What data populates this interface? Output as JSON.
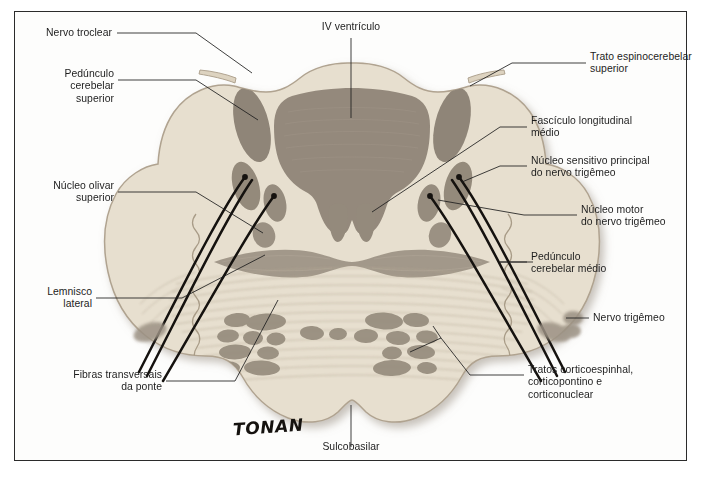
{
  "figure": {
    "signature": "TONAN",
    "colors": {
      "tissue": "#e7dfcf",
      "tissue_edge": "#b5a894",
      "gray_matter": "#8d8275",
      "nucleus": "#9a8f80",
      "leader": "#1d1d1d",
      "frame": "#2b2b2b",
      "nerve_root": "#15120f",
      "background": "#fdfdfc"
    }
  },
  "labels": {
    "nervo_troclear": "Nervo troclear",
    "pedunculo_cerebelar_superior": "Pedúnculo\ncerebelar\nsuperior",
    "nucleo_olivar_superior": "Núcleo olivar\nsuperior",
    "lemnisco_lateral": "Lemnisco\nlateral",
    "fibras_transversais_da_ponte": "Fibras transversais\nda ponte",
    "iv_ventriculo": "IV ventrículo",
    "trato_espinocerebelar_superior": "Trato espinocerebelar\nsuperior",
    "fasciculo_longitudinal_medio": "Fascículo longitudinal\nmédio",
    "nucleo_sensitivo_principal": "Núcleo sensitivo principal\ndo nervo trigêmeo",
    "nucleo_motor": "Núcleo motor\ndo nervo trigêmeo",
    "pedunculo_cerebelar_medio": "Pedúnculo\ncerebelar médio",
    "nervo_trigemeo": "Nervo trigêmeo",
    "tratos_corticoespinhal": "Tratos corticoespinhal,\ncorticopontino e\ncorticonuclear",
    "sulcobasilar": "Sulcobasilar"
  }
}
